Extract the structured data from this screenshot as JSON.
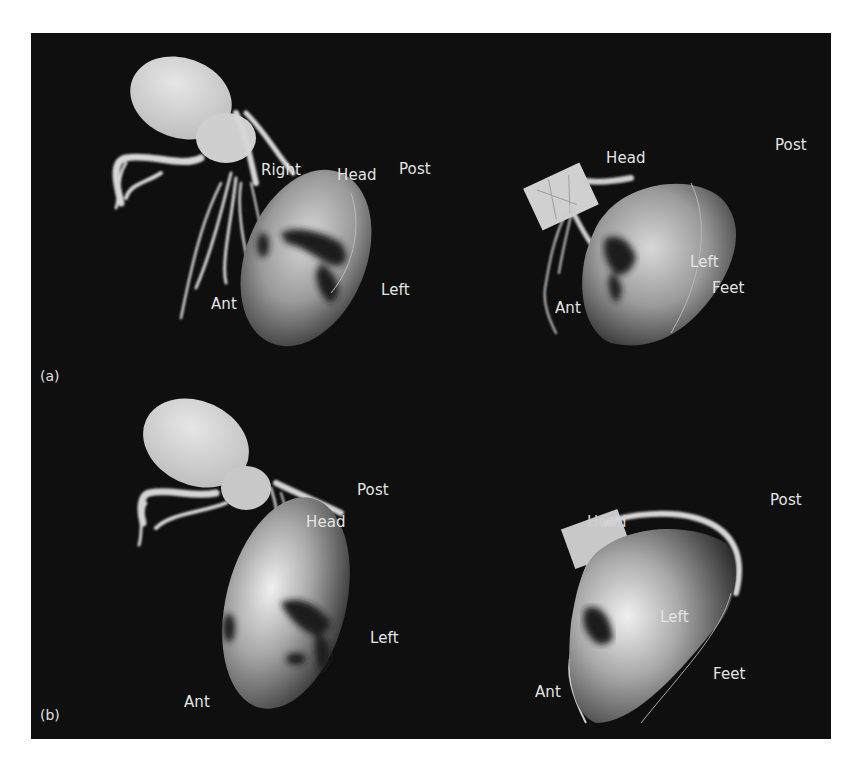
{
  "figure": {
    "background_color": "#0f0f0f",
    "panels": [
      {
        "tag": "(a)",
        "views": [
          {
            "position": "left",
            "labels": {
              "right": "Right",
              "head": "Head",
              "post": "Post",
              "left": "Left",
              "ant": "Ant"
            }
          },
          {
            "position": "right",
            "labels": {
              "head": "Head",
              "post": "Post",
              "left": "Left",
              "feet": "Feet",
              "ant": "Ant"
            }
          }
        ]
      },
      {
        "tag": "(b)",
        "views": [
          {
            "position": "left",
            "labels": {
              "post": "Post",
              "head": "Head",
              "left": "Left",
              "ant": "Ant"
            }
          },
          {
            "position": "right",
            "labels": {
              "post": "Post",
              "head": "Head",
              "left": "Left",
              "feet": "Feet",
              "ant": "Ant"
            }
          }
        ]
      }
    ]
  }
}
